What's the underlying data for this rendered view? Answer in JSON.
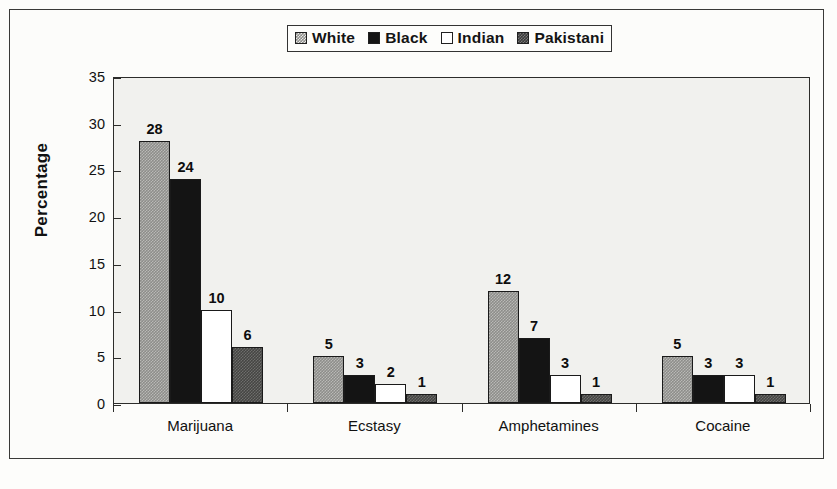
{
  "chart_data": {
    "type": "bar",
    "title": "",
    "xlabel": "",
    "ylabel": "Percentage",
    "ylim": [
      0,
      35
    ],
    "yticks": [
      0,
      5,
      10,
      15,
      20,
      25,
      30,
      35
    ],
    "grid": false,
    "legend_position": "top-center",
    "categories": [
      "Marijuana",
      "Ecstasy",
      "Amphetamines",
      "Cocaine"
    ],
    "series": [
      {
        "name": "White",
        "values": [
          28,
          5,
          12,
          5
        ]
      },
      {
        "name": "Black",
        "values": [
          24,
          3,
          7,
          3
        ]
      },
      {
        "name": "Indian",
        "values": [
          10,
          2,
          3,
          3
        ]
      },
      {
        "name": "Pakistani",
        "values": [
          6,
          1,
          1,
          1
        ]
      }
    ]
  },
  "legend": {
    "items": [
      {
        "label": "White",
        "swatch": "light-gray-dither-swatch"
      },
      {
        "label": "Black",
        "swatch": "black-swatch"
      },
      {
        "label": "Indian",
        "swatch": "white-swatch"
      },
      {
        "label": "Pakistani",
        "swatch": "dark-gray-dither-swatch"
      }
    ]
  },
  "colors": {
    "white_series": "#8d8d8a",
    "black_series": "#141414",
    "indian_series": "#ffffff",
    "pakistani_series": "#454543",
    "plot_background": "#f1f1ee",
    "axis": "#2c2c2a"
  }
}
